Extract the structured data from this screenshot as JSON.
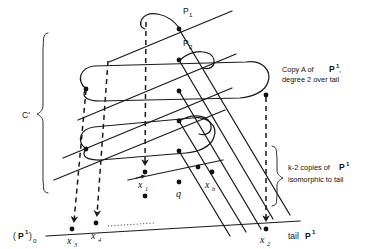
{
  "figure": {
    "caption_absent": true,
    "background_color": "#ffffff",
    "ink_color": "#1a1a1a"
  },
  "annotations": {
    "copy_a": {
      "line1_prefix": "Copy A of",
      "line1_symbol": "P",
      "line1_superscript": "1",
      "line1_suffix": ",",
      "line2": "degree 2 over tail"
    },
    "k_minus_2": {
      "line1_prefix": "k-2 copies of",
      "line1_symbol": "P",
      "line1_superscript": "1",
      "line2": "isomorphic to tail"
    },
    "curve_label": "C'",
    "tail_label": {
      "text": "tail",
      "symbol": "P",
      "superscript": "1"
    },
    "origin_label": {
      "open": "(",
      "symbol": "P",
      "superscript": "1",
      "close": ")",
      "subscript": "0"
    }
  },
  "points": [
    {
      "id": "P1",
      "base": "P",
      "sub": "1",
      "x": 179,
      "y": 29,
      "label_x": 183,
      "label_y": 13
    },
    {
      "id": "P2",
      "base": "P",
      "sub": "2",
      "x": 179,
      "y": 60,
      "label_x": 183,
      "label_y": 45
    },
    {
      "id": "x1",
      "base": "x",
      "sub": "1",
      "x": 145,
      "y": 172,
      "label_x": 139,
      "label_y": 186
    },
    {
      "id": "xb",
      "base": "x",
      "sub": "b",
      "x": 212,
      "y": 172,
      "label_x": 207,
      "label_y": 186
    },
    {
      "id": "q",
      "base": "q",
      "sub": "",
      "x": 179,
      "y": 182,
      "label_x": 176,
      "label_y": 196
    },
    {
      "id": "x3",
      "base": "x",
      "sub": "3",
      "x": 72,
      "y": 228,
      "label_x": 68,
      "label_y": 242
    },
    {
      "id": "x4",
      "base": "x",
      "sub": "4",
      "x": 96,
      "y": 222,
      "label_x": 92,
      "label_y": 238
    },
    {
      "id": "x2",
      "base": "x",
      "sub": "2",
      "x": 266,
      "y": 228,
      "label_x": 261,
      "label_y": 242
    }
  ],
  "dots_on_lines": [
    {
      "x": 179,
      "y": 29
    },
    {
      "x": 179,
      "y": 60
    },
    {
      "x": 179,
      "y": 91
    },
    {
      "x": 179,
      "y": 121
    },
    {
      "x": 179,
      "y": 151
    },
    {
      "x": 145,
      "y": 172
    },
    {
      "x": 212,
      "y": 172
    },
    {
      "x": 179,
      "y": 182
    },
    {
      "x": 86,
      "y": 89
    },
    {
      "x": 86,
      "y": 149
    },
    {
      "x": 266,
      "y": 95
    },
    {
      "x": 72,
      "y": 228
    },
    {
      "x": 96,
      "y": 222
    },
    {
      "x": 266,
      "y": 228
    },
    {
      "x": 145,
      "y": 196
    },
    {
      "x": 198,
      "y": 167
    }
  ],
  "dashed_arrows": [
    {
      "from_x": 86,
      "from_y": 89,
      "to_x": 72,
      "to_y": 224
    },
    {
      "from_x": 108,
      "from_y": 60,
      "to_x": 96,
      "to_y": 218
    },
    {
      "from_x": 146,
      "from_y": 22,
      "to_x": 145,
      "to_y": 168
    },
    {
      "from_x": 266,
      "from_y": 96,
      "to_x": 266,
      "to_y": 224
    }
  ],
  "loops": [
    {
      "id": "upper-loop",
      "left_x": 86,
      "left_y": 89,
      "right_x": 266,
      "right_y": 95
    },
    {
      "id": "lower-loop",
      "left_x": 86,
      "left_y": 149,
      "right_x": 210,
      "right_y": 140
    }
  ],
  "braces": [
    {
      "id": "left-brace",
      "top_y": 33,
      "bottom_y": 190,
      "x": 44,
      "label": "C'"
    },
    {
      "id": "right-brace",
      "top_y": 146,
      "bottom_y": 206,
      "x": 274,
      "label": "k-2 copies"
    }
  ],
  "baseline": {
    "left_x": 46,
    "left_y": 234,
    "right_x": 300,
    "right_y": 222,
    "dotted_from_x": 108,
    "dotted_to_x": 152
  }
}
